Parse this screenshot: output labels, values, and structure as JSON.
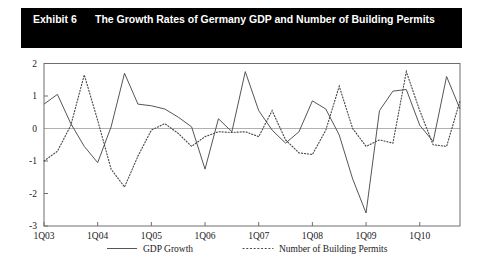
{
  "exhibit": {
    "label": "Exhibit 6",
    "title": "The Growth Rates of Germany GDP and Number of Building Permits"
  },
  "chart_data": {
    "type": "line",
    "title": "The Growth Rates of Germany GDP and Number of Building Permits",
    "xlabel": "",
    "ylabel": "",
    "ylim": [
      -3,
      2
    ],
    "yticks": [
      2,
      1,
      0,
      -1,
      -2,
      -3
    ],
    "ytick_labels": [
      "2",
      "1",
      "0",
      "-1",
      "-2",
      "-3"
    ],
    "xlim": [
      "1Q03",
      "4Q10"
    ],
    "xticks": [
      "1Q03",
      "1Q04",
      "1Q05",
      "1Q06",
      "1Q07",
      "1Q08",
      "1Q09",
      "1Q10"
    ],
    "x": [
      "1Q03",
      "2Q03",
      "3Q03",
      "4Q03",
      "1Q04",
      "2Q04",
      "3Q04",
      "4Q04",
      "1Q05",
      "2Q05",
      "3Q05",
      "4Q05",
      "1Q06",
      "2Q06",
      "3Q06",
      "4Q06",
      "1Q07",
      "2Q07",
      "3Q07",
      "4Q07",
      "1Q08",
      "2Q08",
      "3Q08",
      "4Q08",
      "1Q09",
      "2Q09",
      "3Q09",
      "4Q09",
      "1Q10",
      "2Q10",
      "3Q10",
      "4Q10"
    ],
    "grid": false,
    "zero_line": true,
    "legend_position": "bottom",
    "series": [
      {
        "name": "GDP Growth",
        "style": "solid",
        "color": "#555555",
        "values": [
          0.75,
          1.05,
          0.15,
          -0.55,
          -1.05,
          0.05,
          1.7,
          0.75,
          0.7,
          0.6,
          0.35,
          0.05,
          -1.25,
          0.3,
          -0.1,
          1.75,
          0.55,
          -0.05,
          -0.45,
          -0.1,
          0.85,
          0.6,
          -0.2,
          -1.55,
          -2.6,
          0.55,
          1.15,
          1.2,
          0.1,
          -0.4,
          1.6,
          0.6
        ]
      },
      {
        "name": "Number of Building Permits",
        "style": "dotted",
        "color": "#4a4a4a",
        "values": [
          -1.0,
          -0.7,
          0.1,
          1.65,
          0.25,
          -1.25,
          -1.8,
          -0.85,
          -0.05,
          0.15,
          -0.15,
          -0.55,
          -0.25,
          -0.1,
          -0.12,
          -0.1,
          -0.25,
          0.55,
          -0.35,
          -0.75,
          -0.8,
          -0.05,
          1.3,
          0.0,
          -0.55,
          -0.35,
          -0.45,
          1.75,
          0.55,
          -0.5,
          -0.55,
          0.85
        ]
      }
    ]
  },
  "legend": {
    "items": [
      {
        "label": "GDP Growth",
        "style": "solid"
      },
      {
        "label": "Number of Building Permits",
        "style": "dotted"
      }
    ]
  }
}
